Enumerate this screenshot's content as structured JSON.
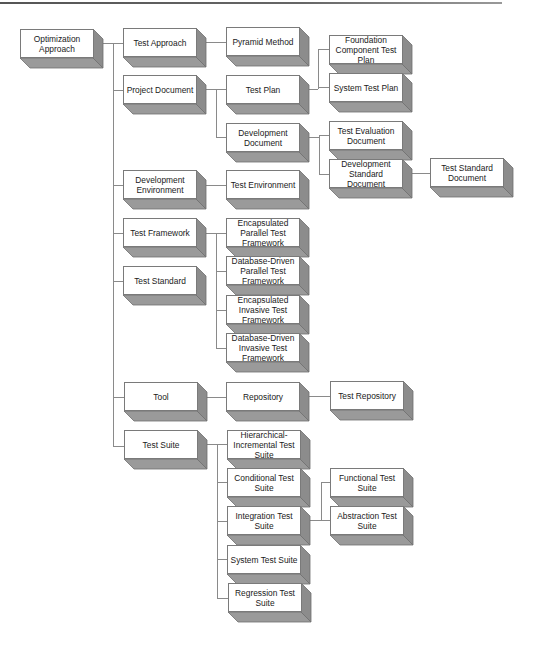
{
  "diagram": {
    "title": "",
    "colors": {
      "face": "#ffffff",
      "side": "#8c8c8c",
      "bottom": "#9a9a9a",
      "edge": "#6e6e6e",
      "connector": "#8a8a8a"
    },
    "nodes": [
      {
        "id": "optimization-approach",
        "label": "Optimization Approach",
        "x": 20,
        "y": 29
      },
      {
        "id": "test-approach",
        "label": "Test Approach",
        "x": 123,
        "y": 28
      },
      {
        "id": "project-document",
        "label": "Project Document",
        "x": 123,
        "y": 75
      },
      {
        "id": "development-environment",
        "label": "Development Environment",
        "x": 123,
        "y": 170
      },
      {
        "id": "test-framework",
        "label": "Test Framework",
        "x": 123,
        "y": 218
      },
      {
        "id": "test-standard",
        "label": "Test Standard",
        "x": 123,
        "y": 266
      },
      {
        "id": "tool",
        "label": "Tool",
        "x": 124,
        "y": 382
      },
      {
        "id": "test-suite",
        "label": "Test Suite",
        "x": 124,
        "y": 430
      },
      {
        "id": "pyramid-method",
        "label": "Pyramid Method",
        "x": 226,
        "y": 27
      },
      {
        "id": "test-plan",
        "label": "Test Plan",
        "x": 226,
        "y": 75
      },
      {
        "id": "development-document",
        "label": "Development Document",
        "x": 226,
        "y": 123
      },
      {
        "id": "test-environment",
        "label": "Test Environment",
        "x": 226,
        "y": 170
      },
      {
        "id": "encapsulated-parallel-test-framework",
        "label": "Encapsulated Parallel Test Framework",
        "x": 226,
        "y": 218
      },
      {
        "id": "database-driven-parallel-test-framework",
        "label": "Database-Driven Parallel Test Framework",
        "x": 226,
        "y": 256
      },
      {
        "id": "encapsulated-invasive-test-framework",
        "label": "Encapsulated Invasive Test Framework",
        "x": 226,
        "y": 295
      },
      {
        "id": "database-driven-invasive-test-framework",
        "label": "Database-Driven Invasive Test Framework",
        "x": 226,
        "y": 333
      },
      {
        "id": "repository",
        "label": "Repository",
        "x": 226,
        "y": 382
      },
      {
        "id": "hierarchical-incremental-test-suite",
        "label": "Hierarchical-Incremental Test Suite",
        "x": 227,
        "y": 430
      },
      {
        "id": "conditional-test-suite",
        "label": "Conditional Test Suite",
        "x": 227,
        "y": 468
      },
      {
        "id": "integration-test-suite",
        "label": "Integration Test Suite",
        "x": 227,
        "y": 506
      },
      {
        "id": "system-test-suite",
        "label": "System Test Suite",
        "x": 227,
        "y": 545
      },
      {
        "id": "regression-test-suite",
        "label": "Regression Test Suite",
        "x": 228,
        "y": 583
      },
      {
        "id": "foundation-component-test-plan",
        "label": "Foundation Component Test Plan",
        "x": 329,
        "y": 35
      },
      {
        "id": "system-test-plan",
        "label": "System Test Plan",
        "x": 329,
        "y": 73
      },
      {
        "id": "test-evaluation-document",
        "label": "Test Evaluation Document",
        "x": 329,
        "y": 121
      },
      {
        "id": "development-standard-document",
        "label": "Development Standard Document",
        "x": 329,
        "y": 159
      },
      {
        "id": "test-repository",
        "label": "Test Repository",
        "x": 330,
        "y": 381
      },
      {
        "id": "functional-test-suite",
        "label": "Functional Test Suite",
        "x": 330,
        "y": 468
      },
      {
        "id": "abstraction-test-suite",
        "label": "Abstraction Test Suite",
        "x": 330,
        "y": 506
      },
      {
        "id": "test-standard-document",
        "label": "Test Standard Document",
        "x": 430,
        "y": 158
      }
    ],
    "edges": [
      {
        "from": "optimization-approach",
        "to": "test-approach"
      },
      {
        "from": "optimization-approach",
        "to": "project-document"
      },
      {
        "from": "optimization-approach",
        "to": "development-environment"
      },
      {
        "from": "optimization-approach",
        "to": "test-framework"
      },
      {
        "from": "optimization-approach",
        "to": "test-standard"
      },
      {
        "from": "optimization-approach",
        "to": "tool"
      },
      {
        "from": "optimization-approach",
        "to": "test-suite"
      },
      {
        "from": "test-approach",
        "to": "pyramid-method"
      },
      {
        "from": "project-document",
        "to": "test-plan"
      },
      {
        "from": "project-document",
        "to": "development-document"
      },
      {
        "from": "test-plan",
        "to": "foundation-component-test-plan"
      },
      {
        "from": "test-plan",
        "to": "system-test-plan"
      },
      {
        "from": "development-document",
        "to": "test-evaluation-document"
      },
      {
        "from": "development-document",
        "to": "development-standard-document"
      },
      {
        "from": "development-standard-document",
        "to": "test-standard-document"
      },
      {
        "from": "development-environment",
        "to": "test-environment"
      },
      {
        "from": "test-framework",
        "to": "encapsulated-parallel-test-framework"
      },
      {
        "from": "test-framework",
        "to": "database-driven-parallel-test-framework"
      },
      {
        "from": "test-framework",
        "to": "encapsulated-invasive-test-framework"
      },
      {
        "from": "test-framework",
        "to": "database-driven-invasive-test-framework"
      },
      {
        "from": "tool",
        "to": "repository"
      },
      {
        "from": "repository",
        "to": "test-repository"
      },
      {
        "from": "test-suite",
        "to": "hierarchical-incremental-test-suite"
      },
      {
        "from": "test-suite",
        "to": "conditional-test-suite"
      },
      {
        "from": "test-suite",
        "to": "integration-test-suite"
      },
      {
        "from": "test-suite",
        "to": "system-test-suite"
      },
      {
        "from": "test-suite",
        "to": "regression-test-suite"
      },
      {
        "from": "integration-test-suite",
        "to": "functional-test-suite"
      },
      {
        "from": "integration-test-suite",
        "to": "abstraction-test-suite"
      }
    ],
    "connectors": [
      {
        "x1": 96,
        "y1": 43,
        "x2": 113,
        "y2": 43
      },
      {
        "x1": 113,
        "y1": 43,
        "x2": 113,
        "y2": 446
      },
      {
        "x1": 113,
        "y1": 43,
        "x2": 123,
        "y2": 43
      },
      {
        "x1": 113,
        "y1": 90,
        "x2": 123,
        "y2": 90
      },
      {
        "x1": 113,
        "y1": 185,
        "x2": 123,
        "y2": 185
      },
      {
        "x1": 113,
        "y1": 233,
        "x2": 123,
        "y2": 233
      },
      {
        "x1": 113,
        "y1": 281,
        "x2": 123,
        "y2": 281
      },
      {
        "x1": 113,
        "y1": 397,
        "x2": 124,
        "y2": 397
      },
      {
        "x1": 113,
        "y1": 446,
        "x2": 124,
        "y2": 446
      },
      {
        "x1": 197,
        "y1": 42,
        "x2": 226,
        "y2": 42
      },
      {
        "x1": 197,
        "y1": 89,
        "x2": 226,
        "y2": 89
      },
      {
        "x1": 216,
        "y1": 89,
        "x2": 216,
        "y2": 137
      },
      {
        "x1": 216,
        "y1": 137,
        "x2": 226,
        "y2": 137
      },
      {
        "x1": 300,
        "y1": 89,
        "x2": 318,
        "y2": 89
      },
      {
        "x1": 318,
        "y1": 49,
        "x2": 318,
        "y2": 89
      },
      {
        "x1": 318,
        "y1": 49,
        "x2": 329,
        "y2": 49
      },
      {
        "x1": 318,
        "y1": 87,
        "x2": 329,
        "y2": 87
      },
      {
        "x1": 300,
        "y1": 137,
        "x2": 319,
        "y2": 137
      },
      {
        "x1": 319,
        "y1": 135,
        "x2": 319,
        "y2": 174
      },
      {
        "x1": 319,
        "y1": 135,
        "x2": 329,
        "y2": 135
      },
      {
        "x1": 319,
        "y1": 174,
        "x2": 329,
        "y2": 174
      },
      {
        "x1": 403,
        "y1": 173,
        "x2": 430,
        "y2": 173
      },
      {
        "x1": 197,
        "y1": 185,
        "x2": 226,
        "y2": 185
      },
      {
        "x1": 197,
        "y1": 233,
        "x2": 216,
        "y2": 233
      },
      {
        "x1": 216,
        "y1": 233,
        "x2": 216,
        "y2": 348
      },
      {
        "x1": 216,
        "y1": 233,
        "x2": 226,
        "y2": 233
      },
      {
        "x1": 216,
        "y1": 271,
        "x2": 226,
        "y2": 271
      },
      {
        "x1": 216,
        "y1": 310,
        "x2": 226,
        "y2": 310
      },
      {
        "x1": 216,
        "y1": 348,
        "x2": 226,
        "y2": 348
      },
      {
        "x1": 198,
        "y1": 397,
        "x2": 226,
        "y2": 397
      },
      {
        "x1": 300,
        "y1": 396,
        "x2": 330,
        "y2": 396
      },
      {
        "x1": 198,
        "y1": 444,
        "x2": 217,
        "y2": 444
      },
      {
        "x1": 217,
        "y1": 444,
        "x2": 217,
        "y2": 598
      },
      {
        "x1": 217,
        "y1": 444,
        "x2": 227,
        "y2": 444
      },
      {
        "x1": 217,
        "y1": 482,
        "x2": 227,
        "y2": 482
      },
      {
        "x1": 217,
        "y1": 521,
        "x2": 227,
        "y2": 521
      },
      {
        "x1": 217,
        "y1": 559,
        "x2": 227,
        "y2": 559
      },
      {
        "x1": 217,
        "y1": 598,
        "x2": 228,
        "y2": 598
      },
      {
        "x1": 301,
        "y1": 520,
        "x2": 321,
        "y2": 520
      },
      {
        "x1": 321,
        "y1": 482,
        "x2": 321,
        "y2": 520
      },
      {
        "x1": 321,
        "y1": 482,
        "x2": 330,
        "y2": 482
      },
      {
        "x1": 321,
        "y1": 520,
        "x2": 330,
        "y2": 520
      }
    ]
  }
}
